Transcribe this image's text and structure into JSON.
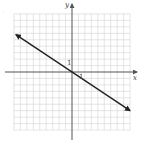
{
  "chart_data": {
    "type": "line",
    "title": "",
    "xlabel": "x",
    "ylabel": "y",
    "xlim": [
      -9,
      9
    ],
    "ylim": [
      -9,
      9
    ],
    "grid": true,
    "grid_step": 1,
    "tick_labels": {
      "x": "1",
      "y": "1"
    },
    "series": [
      {
        "name": "y = -2/3 x",
        "slope": -0.6667,
        "intercept": 0,
        "x": [
          -8.7,
          0,
          9
        ],
        "y": [
          5.6,
          0,
          -6.1
        ],
        "arrows_both_ends": true
      }
    ],
    "legend": null
  },
  "labels": {
    "x_axis": "x",
    "y_axis": "y",
    "x_tick": "1",
    "y_tick": "1",
    "corner_mark": "·"
  },
  "colors": {
    "grid": "#d4d4d4",
    "axis": "#555555",
    "line": "#222222"
  }
}
